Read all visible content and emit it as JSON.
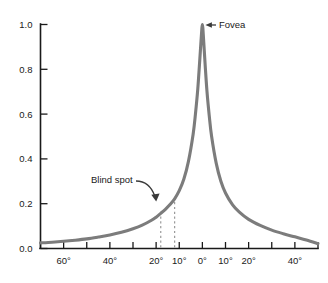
{
  "chart_data": {
    "type": "line",
    "title": "",
    "subtitle": "",
    "xlabel": "",
    "ylabel": "",
    "xlim": [
      -70,
      50
    ],
    "ylim": [
      0.0,
      1.0
    ],
    "grid": false,
    "legend_position": "none",
    "y_ticks": [
      "1.0",
      "0.8",
      "0.6",
      "0.4",
      "0.2",
      "0.0"
    ],
    "y_tick_values": [
      1.0,
      0.8,
      0.6,
      0.4,
      0.2,
      0.0
    ],
    "x_ticks": [
      {
        "value": -70,
        "label": ""
      },
      {
        "value": -60,
        "label": "60°"
      },
      {
        "value": -50,
        "label": ""
      },
      {
        "value": -40,
        "label": "40°"
      },
      {
        "value": -30,
        "label": ""
      },
      {
        "value": -20,
        "label": "20°"
      },
      {
        "value": -10,
        "label": "10°"
      },
      {
        "value": 0,
        "label": "0°"
      },
      {
        "value": 10,
        "label": "10°"
      },
      {
        "value": 20,
        "label": "20°"
      },
      {
        "value": 30,
        "label": ""
      },
      {
        "value": 40,
        "label": "40°"
      },
      {
        "value": 50,
        "label": ""
      }
    ],
    "series": [
      {
        "name": "Relative visual acuity",
        "color": "#7c7c7c",
        "points": [
          {
            "x": -70,
            "y": 0.025
          },
          {
            "x": -65,
            "y": 0.028
          },
          {
            "x": -60,
            "y": 0.032
          },
          {
            "x": -55,
            "y": 0.037
          },
          {
            "x": -50,
            "y": 0.043
          },
          {
            "x": -45,
            "y": 0.051
          },
          {
            "x": -40,
            "y": 0.06
          },
          {
            "x": -35,
            "y": 0.072
          },
          {
            "x": -30,
            "y": 0.088
          },
          {
            "x": -26,
            "y": 0.104
          },
          {
            "x": -22,
            "y": 0.126
          },
          {
            "x": -20,
            "y": 0.14
          },
          {
            "x": -18,
            "y": 0.157
          },
          {
            "x": -16,
            "y": 0.175
          },
          {
            "x": -14,
            "y": 0.196
          },
          {
            "x": -12,
            "y": 0.222
          },
          {
            "x": -10,
            "y": 0.258
          },
          {
            "x": -8,
            "y": 0.31
          },
          {
            "x": -6,
            "y": 0.39
          },
          {
            "x": -4,
            "y": 0.51
          },
          {
            "x": -3,
            "y": 0.6
          },
          {
            "x": -2,
            "y": 0.71
          },
          {
            "x": -1.2,
            "y": 0.83
          },
          {
            "x": -0.6,
            "y": 0.925
          },
          {
            "x": -0.2,
            "y": 0.985
          },
          {
            "x": 0,
            "y": 1.0
          },
          {
            "x": 0.2,
            "y": 0.985
          },
          {
            "x": 0.6,
            "y": 0.92
          },
          {
            "x": 1.2,
            "y": 0.82
          },
          {
            "x": 2,
            "y": 0.7
          },
          {
            "x": 3,
            "y": 0.59
          },
          {
            "x": 4,
            "y": 0.5
          },
          {
            "x": 6,
            "y": 0.38
          },
          {
            "x": 8,
            "y": 0.3
          },
          {
            "x": 10,
            "y": 0.248
          },
          {
            "x": 13,
            "y": 0.196
          },
          {
            "x": 16,
            "y": 0.162
          },
          {
            "x": 20,
            "y": 0.13
          },
          {
            "x": 25,
            "y": 0.103
          },
          {
            "x": 30,
            "y": 0.082
          },
          {
            "x": 35,
            "y": 0.066
          },
          {
            "x": 40,
            "y": 0.052
          },
          {
            "x": 45,
            "y": 0.038
          },
          {
            "x": 50,
            "y": 0.022
          }
        ]
      }
    ],
    "annotations": [
      {
        "id": "fovea",
        "label": "Fovea",
        "target_x": 0,
        "target_y": 1.0,
        "arrow": "left-pointing-straight"
      },
      {
        "id": "blind-spot",
        "label": "Blind spot",
        "target_x": -14,
        "target_y": 0.2,
        "arrow": "curved-down-right"
      }
    ],
    "markers": [
      {
        "id": "blind-spot-region",
        "type": "vertical-dashed-pair",
        "x_start": -18,
        "x_end": -12,
        "color": "#9a9a9a"
      }
    ]
  },
  "colors": {
    "curve": "#7c7c7c",
    "axis": "#1a1a1a",
    "dashed": "#9a9a9a",
    "annotation": "#3a3a3a",
    "background": "#ffffff"
  },
  "labels": {
    "fovea": "Fovea",
    "blind_spot": "Blind spot"
  }
}
